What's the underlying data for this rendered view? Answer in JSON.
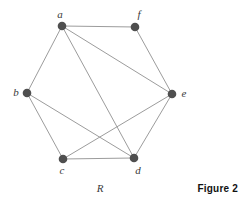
{
  "figure": {
    "graph_label": "R",
    "caption": "Figure 2"
  },
  "graph": {
    "type": "undirected-graph",
    "node_color": "#4f4f4f",
    "edge_color": "#9c9c9c",
    "node_radius": 4.3,
    "edge_width": 1,
    "nodes": [
      {
        "id": "a",
        "label": "a",
        "x": 62,
        "y": 26,
        "label_x": 60,
        "label_y": 18
      },
      {
        "id": "f",
        "label": "f",
        "x": 135,
        "y": 27,
        "label_x": 139,
        "label_y": 18
      },
      {
        "id": "b",
        "label": "b",
        "x": 27,
        "y": 93,
        "label_x": 16,
        "label_y": 96
      },
      {
        "id": "e",
        "label": "e",
        "x": 172,
        "y": 94,
        "label_x": 184,
        "label_y": 97
      },
      {
        "id": "c",
        "label": "c",
        "x": 63,
        "y": 159,
        "label_x": 62,
        "label_y": 174
      },
      {
        "id": "d",
        "label": "d",
        "x": 134,
        "y": 158,
        "label_x": 138,
        "label_y": 174
      }
    ],
    "edges": [
      [
        "a",
        "f"
      ],
      [
        "a",
        "b"
      ],
      [
        "a",
        "e"
      ],
      [
        "a",
        "d"
      ],
      [
        "b",
        "c"
      ],
      [
        "b",
        "d"
      ],
      [
        "c",
        "d"
      ],
      [
        "c",
        "e"
      ],
      [
        "d",
        "e"
      ],
      [
        "e",
        "f"
      ]
    ]
  }
}
